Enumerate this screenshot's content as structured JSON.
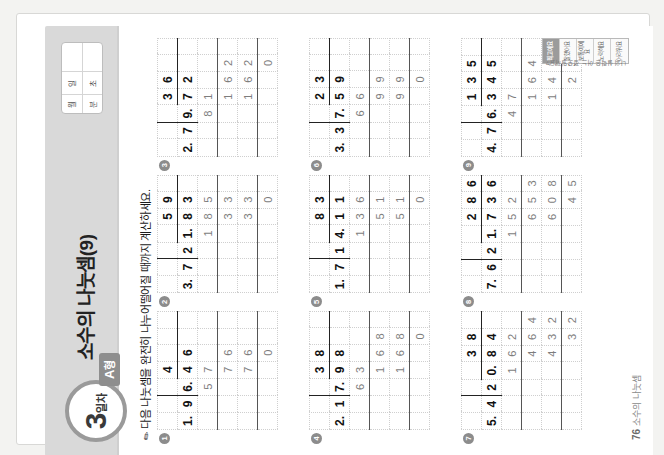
{
  "header": {
    "day_number": "3",
    "day_suffix": "일차",
    "form_badge": "A",
    "form_badge_suffix": "형",
    "title": "소수의 나눗셈(9)",
    "datebox": {
      "month_label": "월",
      "day_label": "일",
      "minute_label": "분",
      "second_label": "초"
    }
  },
  "instruction": {
    "icon": "pencil-icon",
    "text": "다음 나눗셈을 완전히 나누어떨어질 때까지 계산하세요."
  },
  "problems": [
    {
      "marker": "1",
      "divisor": "1.9",
      "dividend": "6.4 6",
      "rows": [
        [
          " ",
          " ",
          " ",
          "4",
          " ",
          " "
        ],
        [
          "1.",
          "9",
          ")6.",
          "4",
          "6",
          " "
        ],
        [
          " ",
          " ",
          "5",
          "7",
          " ",
          " "
        ],
        [
          " ",
          " ",
          " ",
          "7",
          "6",
          " "
        ],
        [
          " ",
          " ",
          " ",
          "7",
          "6",
          " "
        ],
        [
          " ",
          " ",
          " ",
          " ",
          "0",
          " "
        ]
      ]
    },
    {
      "marker": "2",
      "divisor": "3.7",
      "dividend": "21.8 3",
      "rows": [
        [
          " ",
          " ",
          " ",
          " ",
          "5",
          "9"
        ],
        [
          "3.",
          "7",
          ")2",
          "1.",
          "8",
          "3"
        ],
        [
          " ",
          " ",
          " ",
          "1",
          "8",
          "5"
        ],
        [
          " ",
          " ",
          " ",
          " ",
          "3",
          "3"
        ],
        [
          " ",
          " ",
          " ",
          " ",
          "3",
          "3"
        ],
        [
          " ",
          " ",
          " ",
          " ",
          " ",
          "0"
        ]
      ]
    },
    {
      "marker": "3",
      "divisor": "2.7",
      "dividend": "9.7 2",
      "rows": [
        [
          " ",
          " ",
          " ",
          "3",
          "6",
          " "
        ],
        [
          "2.",
          "7",
          ")9.",
          "7",
          "2",
          " "
        ],
        [
          " ",
          " ",
          "8",
          "1",
          " ",
          " "
        ],
        [
          " ",
          " ",
          " ",
          "1",
          "6",
          "2"
        ],
        [
          " ",
          " ",
          " ",
          "1",
          "6",
          "2"
        ],
        [
          " ",
          " ",
          " ",
          " ",
          " ",
          "0"
        ]
      ]
    },
    {
      "marker": "4",
      "divisor": "2.1",
      "dividend": "7.9 8",
      "rows": [
        [
          " ",
          " ",
          " ",
          "3",
          "8",
          " "
        ],
        [
          "2.",
          "1",
          ")7.",
          "9",
          "8",
          " "
        ],
        [
          " ",
          " ",
          "6",
          "3",
          " ",
          " "
        ],
        [
          " ",
          " ",
          " ",
          "1",
          "6",
          "8"
        ],
        [
          " ",
          " ",
          " ",
          "1",
          "6",
          "8"
        ],
        [
          " ",
          " ",
          " ",
          " ",
          " ",
          "0"
        ]
      ]
    },
    {
      "marker": "5",
      "divisor": "1.7",
      "dividend": "14.1 1",
      "rows": [
        [
          " ",
          " ",
          " ",
          " ",
          "8",
          "3"
        ],
        [
          "1.",
          "7",
          ")1",
          "4.",
          "1",
          "1"
        ],
        [
          " ",
          " ",
          " ",
          "1",
          "3",
          "6"
        ],
        [
          " ",
          " ",
          " ",
          " ",
          "5",
          "1"
        ],
        [
          " ",
          " ",
          " ",
          " ",
          "5",
          "1"
        ],
        [
          " ",
          " ",
          " ",
          " ",
          " ",
          "0"
        ]
      ]
    },
    {
      "marker": "6",
      "divisor": "3.3",
      "dividend": "7.5 9",
      "rows": [
        [
          " ",
          " ",
          " ",
          "2",
          "3",
          " "
        ],
        [
          "3.",
          "3",
          ")7.",
          "5",
          "9",
          " "
        ],
        [
          " ",
          " ",
          "6",
          "6",
          " ",
          " "
        ],
        [
          " ",
          " ",
          " ",
          "9",
          "9",
          " "
        ],
        [
          " ",
          " ",
          " ",
          "9",
          "9",
          " "
        ],
        [
          " ",
          " ",
          " ",
          " ",
          "0",
          " "
        ]
      ]
    },
    {
      "marker": "7",
      "divisor": "5.4",
      "dividend": "20.8 4",
      "rows": [
        [
          " ",
          " ",
          " ",
          " ",
          "3",
          "8"
        ],
        [
          "5.",
          "4",
          ")2",
          "0.",
          "8",
          "4"
        ],
        [
          " ",
          " ",
          " ",
          "1",
          "6",
          "2"
        ],
        [
          " ",
          " ",
          " ",
          " ",
          "4",
          "6",
          "4"
        ],
        [
          " ",
          " ",
          " ",
          " ",
          "4",
          "3",
          "2"
        ],
        [
          " ",
          " ",
          " ",
          " ",
          " ",
          "3",
          "2"
        ]
      ]
    },
    {
      "marker": "8",
      "divisor": "7.6",
      "dividend": "21.7 3 6",
      "rows": [
        [
          " ",
          " ",
          " ",
          " ",
          "2",
          "8",
          "6"
        ],
        [
          "7.",
          "6",
          ")2",
          "1.",
          "7",
          "3",
          "6"
        ],
        [
          " ",
          " ",
          " ",
          "1",
          "5",
          "2",
          " "
        ],
        [
          " ",
          " ",
          " ",
          " ",
          "6",
          "5",
          "3"
        ],
        [
          " ",
          " ",
          " ",
          " ",
          "6",
          "0",
          "8"
        ],
        [
          " ",
          " ",
          " ",
          " ",
          " ",
          "4",
          "5",
          "6"
        ]
      ]
    },
    {
      "marker": "9",
      "divisor": "4.7",
      "dividend": "6.3 4 5",
      "rows": [
        [
          " ",
          " ",
          " ",
          "1",
          "3",
          "5"
        ],
        [
          "4.",
          "7",
          ")6.",
          "3",
          "4",
          "5"
        ],
        [
          " ",
          " ",
          "4",
          "7",
          " ",
          " "
        ],
        [
          " ",
          " ",
          " ",
          "1",
          "6",
          "4"
        ],
        [
          " ",
          " ",
          " ",
          "1",
          "4",
          "1"
        ],
        [
          " ",
          " ",
          " ",
          " ",
          "2",
          "3",
          "5"
        ]
      ]
    }
  ],
  "footer": {
    "page_number": "76",
    "chapter": "소수의 나눗셈"
  },
  "selfcheck": {
    "title": "나의 실력은 어느 정도일까요?",
    "cells": [
      "최고예요",
      "잘했어요",
      "보통이에요",
      "노력해요",
      "어려워요"
    ]
  },
  "colors": {
    "band": "#d9d9d9",
    "accent": "#8e8e8e",
    "ink": "#111111",
    "grid": "#cfcfcf"
  }
}
